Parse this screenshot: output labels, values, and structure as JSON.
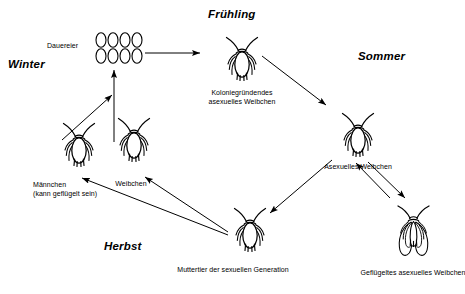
{
  "diagram": {
    "background_color": "#ffffff",
    "ink_color": "#000000",
    "seasons": [
      {
        "key": "winter",
        "label": "Winter",
        "x": 8,
        "y": 58
      },
      {
        "key": "fruehling",
        "label": "Frühling",
        "x": 208,
        "y": 8
      },
      {
        "key": "sommer",
        "label": "Sommer",
        "x": 358,
        "y": 50
      },
      {
        "key": "herbst",
        "label": "Herbst",
        "x": 104,
        "y": 240
      }
    ],
    "eggs": {
      "label": "Dauereier",
      "count": 8,
      "rows": 2,
      "columns": 4
    },
    "organisms": [
      {
        "key": "koloniegruendendes-weibchen",
        "caption_line_1": "Koloniegründendes",
        "caption_line_2": "asexuelles Weibchen",
        "form": "wingless",
        "x": 225,
        "y": 37,
        "scale": 1.0
      },
      {
        "key": "asexuelles-weibchen",
        "caption_line_1": "Asexuelles Weibchen",
        "caption_line_2": "",
        "form": "wingless",
        "x": 341,
        "y": 113,
        "scale": 1.0
      },
      {
        "key": "gefluegeltes-asexuelles-weibchen",
        "caption_line_1": "Geflügeltes asexuelles Weibchen",
        "caption_line_2": "",
        "form": "winged",
        "x": 396,
        "y": 208,
        "scale": 1.0
      },
      {
        "key": "muttertier-sexuelle-generation",
        "caption_line_1": "Muttertier der sexuellen Generation",
        "caption_line_2": "",
        "form": "wingless",
        "x": 233,
        "y": 208,
        "scale": 1.0
      },
      {
        "key": "weibchen",
        "caption_line_1": "Weibchen",
        "caption_line_2": "",
        "form": "wingless",
        "x": 117,
        "y": 118,
        "scale": 0.95
      },
      {
        "key": "maennchen",
        "caption_line_1": "Männchen",
        "caption_line_2": "(kann geflügelt sein)",
        "form": "wingless",
        "x": 62,
        "y": 123,
        "scale": 0.9
      }
    ],
    "flows": [
      {
        "from": "dauereier",
        "to": "koloniegruendendes-weibchen"
      },
      {
        "from": "koloniegruendendes-weibchen",
        "to": "asexuelles-weibchen"
      },
      {
        "from": "asexuelles-weibchen",
        "to": "gefluegeltes-asexuelles-weibchen"
      },
      {
        "from": "gefluegeltes-asexuelles-weibchen",
        "to": "asexuelles-weibchen"
      },
      {
        "from": "asexuelles-weibchen",
        "to": "muttertier-sexuelle-generation"
      },
      {
        "from": "muttertier-sexuelle-generation",
        "to": "maennchen"
      },
      {
        "from": "muttertier-sexuelle-generation",
        "to": "weibchen"
      },
      {
        "from": "maennchen",
        "to": "dauereier"
      },
      {
        "from": "weibchen",
        "to": "dauereier"
      }
    ]
  }
}
